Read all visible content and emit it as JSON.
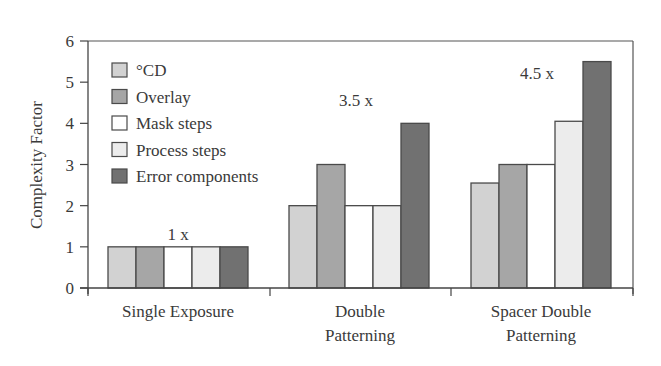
{
  "chart_data": {
    "type": "bar",
    "title": "",
    "xlabel": "",
    "ylabel": "Complexity Factor",
    "ylim": [
      0,
      6
    ],
    "yticks": [
      0,
      1,
      2,
      3,
      4,
      5,
      6
    ],
    "grid": false,
    "legend_position": "upper-left inside",
    "categories": [
      "Single Exposure",
      "Double Patterning",
      "Spacer Double Patterning"
    ],
    "category_label_lines": [
      [
        "Single Exposure"
      ],
      [
        "Double",
        "Patterning"
      ],
      [
        "Spacer Double",
        "Patterning"
      ]
    ],
    "series": [
      {
        "name": "°CD",
        "color": "#d2d2d2",
        "values": [
          1,
          2,
          2.55
        ]
      },
      {
        "name": "Overlay",
        "color": "#a6a6a6",
        "values": [
          1,
          3,
          3
        ]
      },
      {
        "name": "Mask steps",
        "color": "#ffffff",
        "values": [
          1,
          2,
          3
        ]
      },
      {
        "name": "Process steps",
        "color": "#ececec",
        "values": [
          1,
          2,
          4.05
        ]
      },
      {
        "name": "Error components",
        "color": "#717171",
        "values": [
          1,
          4,
          5.5
        ]
      }
    ],
    "annotations": [
      {
        "text": "1 x",
        "category": "Single Exposure"
      },
      {
        "text": "3.5 x",
        "category": "Double Patterning"
      },
      {
        "text": "4.5 x",
        "category": "Spacer Double Patterning"
      }
    ]
  }
}
